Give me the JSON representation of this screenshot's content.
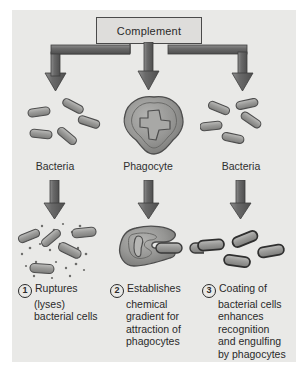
{
  "figure": {
    "title_box": "Complement",
    "background_color": "#e9e9e7",
    "outline_color": "#4a4a4a",
    "cell_fill": "#9a9a98",
    "arrow_color": "#6e6e6e"
  },
  "row_labels": [
    {
      "name": "bacteria-left",
      "text": "Bacteria"
    },
    {
      "name": "phagocyte-center",
      "text": "Phagocyte"
    },
    {
      "name": "bacteria-right",
      "text": "Bacteria"
    }
  ],
  "captions": [
    {
      "number": "1",
      "lines": [
        "Ruptures",
        "(lyses)",
        "bacterial cells"
      ]
    },
    {
      "number": "2",
      "lines": [
        "Establishes",
        "chemical",
        "gradient for",
        "attraction of",
        "phagocytes"
      ]
    },
    {
      "number": "3",
      "lines": [
        "Coating of",
        "bacterial cells",
        "enhances",
        "recognition",
        "and engulfing",
        "by phagocytes"
      ]
    }
  ],
  "arrows": {
    "top_row": [
      "elbow-left",
      "straight-center",
      "elbow-right"
    ],
    "second_row": [
      "straight-left",
      "straight-center",
      "straight-right"
    ]
  }
}
